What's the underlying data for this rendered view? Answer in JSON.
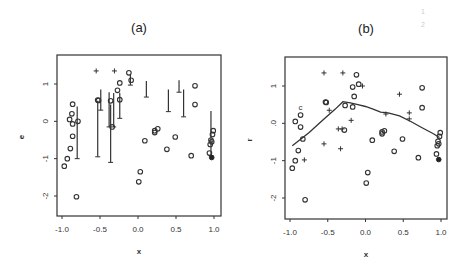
{
  "chart_data": [
    {
      "type": "scatter",
      "panel": "(a)",
      "title": "(a)",
      "xlabel": "x",
      "ylabel": "e",
      "xlim": [
        -1.05,
        1.05
      ],
      "ylim": [
        -2.6,
        1.6
      ],
      "xticks": [
        "-1.0",
        "-0.5",
        "0.0",
        "0.5",
        "1.0"
      ],
      "yticks": [
        "1",
        "0",
        "-1",
        "-2"
      ],
      "grid": false,
      "legend": null,
      "circles": [
        [
          -0.97,
          -1.2
        ],
        [
          -0.93,
          -1.0
        ],
        [
          -0.89,
          -0.73
        ],
        [
          -0.81,
          -2.02
        ],
        [
          -0.86,
          -0.4
        ],
        [
          -0.86,
          -0.07
        ],
        [
          -0.87,
          0.2
        ],
        [
          -0.86,
          0.46
        ],
        [
          -0.9,
          0.05
        ],
        [
          -0.79,
          0.0
        ],
        [
          -0.53,
          0.57
        ],
        [
          -0.52,
          0.56
        ],
        [
          -0.36,
          0.55
        ],
        [
          -0.34,
          -0.15
        ],
        [
          -0.27,
          0.83
        ],
        [
          -0.24,
          0.58
        ],
        [
          -0.24,
          1.03
        ],
        [
          -0.12,
          1.3
        ],
        [
          -0.09,
          1.1
        ],
        [
          0.01,
          -1.62
        ],
        [
          0.03,
          -1.35
        ],
        [
          0.09,
          -0.52
        ],
        [
          0.22,
          -0.3
        ],
        [
          0.22,
          -0.25
        ],
        [
          0.26,
          -0.2
        ],
        [
          0.38,
          -0.75
        ],
        [
          0.49,
          -0.42
        ],
        [
          0.7,
          -0.92
        ],
        [
          0.75,
          0.95
        ],
        [
          0.75,
          0.45
        ],
        [
          0.94,
          -0.85
        ],
        [
          0.95,
          -0.62
        ],
        [
          0.96,
          -0.5
        ],
        [
          0.98,
          -0.35
        ],
        [
          0.99,
          -0.25
        ],
        [
          0.97,
          -0.55
        ]
      ],
      "filled_points": [
        [
          0.97,
          -0.97
        ]
      ],
      "plus_points": [
        [
          -0.55,
          1.35
        ],
        [
          -0.31,
          1.35
        ]
      ],
      "arrows_down": [
        {
          "x": -0.8,
          "from": 0.4,
          "to": -1.0
        },
        {
          "x": -0.53,
          "from": 0.55,
          "to": -0.95
        },
        {
          "x": -0.49,
          "from": 0.85,
          "to": 0.3
        },
        {
          "x": -0.38,
          "from": 0.78,
          "to": -0.15
        },
        {
          "x": -0.36,
          "from": 0.45,
          "to": -1.1
        },
        {
          "x": -0.32,
          "from": 0.76,
          "to": -0.15
        },
        {
          "x": -0.24,
          "from": 0.76,
          "to": 0.08
        },
        {
          "x": -0.1,
          "from": 1.25,
          "to": 0.97
        },
        {
          "x": 0.11,
          "from": 1.08,
          "to": 0.65
        },
        {
          "x": 0.4,
          "from": 0.85,
          "to": 0.26
        },
        {
          "x": 0.54,
          "from": 1.1,
          "to": 0.78
        },
        {
          "x": 0.6,
          "from": 0.85,
          "to": 0.12
        },
        {
          "x": 0.96,
          "from": 0.28,
          "to": -0.92
        }
      ]
    },
    {
      "type": "scatter",
      "panel": "(b)",
      "title": "(b)",
      "xlabel": "x",
      "ylabel": "r",
      "xlim": [
        -1.05,
        1.05
      ],
      "ylim": [
        -2.6,
        1.6
      ],
      "xticks": [
        "-1.0",
        "-0.5",
        "0.0",
        "0.5",
        "1.0"
      ],
      "yticks": [
        "1",
        ".0",
        "-1",
        "-2"
      ],
      "grid": false,
      "legend": null,
      "circles": [
        [
          -0.97,
          -1.2
        ],
        [
          -0.93,
          -1.0
        ],
        [
          -0.89,
          -0.73
        ],
        [
          -0.8,
          -2.05
        ],
        [
          -0.83,
          -0.42
        ],
        [
          -0.86,
          -0.1
        ],
        [
          -0.86,
          0.22
        ],
        [
          -0.93,
          0.05
        ],
        [
          -0.53,
          0.57
        ],
        [
          -0.52,
          0.56
        ],
        [
          -0.27,
          0.48
        ],
        [
          -0.28,
          -0.18
        ],
        [
          -0.17,
          0.97
        ],
        [
          -0.15,
          0.72
        ],
        [
          -0.12,
          1.3
        ],
        [
          -0.09,
          1.05
        ],
        [
          -0.17,
          0.44
        ],
        [
          0.01,
          -1.6
        ],
        [
          0.03,
          -1.32
        ],
        [
          0.09,
          -0.45
        ],
        [
          0.22,
          -0.28
        ],
        [
          0.22,
          -0.23
        ],
        [
          0.25,
          -0.2
        ],
        [
          0.38,
          -0.75
        ],
        [
          0.49,
          -0.42
        ],
        [
          0.7,
          -0.92
        ],
        [
          0.75,
          0.95
        ],
        [
          0.75,
          0.42
        ],
        [
          0.94,
          -0.82
        ],
        [
          0.95,
          -0.6
        ],
        [
          0.96,
          -0.48
        ],
        [
          0.98,
          -0.35
        ],
        [
          0.99,
          -0.25
        ],
        [
          0.97,
          -0.55
        ]
      ],
      "c_points": [
        [
          -0.86,
          0.45
        ]
      ],
      "filled_points": [
        [
          0.97,
          -0.97
        ]
      ],
      "plus_points": [
        [
          -0.55,
          1.35
        ],
        [
          -0.3,
          1.35
        ],
        [
          -0.04,
          1.0
        ],
        [
          -0.48,
          0.35
        ],
        [
          -0.19,
          0.08
        ],
        [
          -0.36,
          -0.15
        ],
        [
          -0.31,
          -0.15
        ],
        [
          -0.55,
          -0.55
        ],
        [
          -0.33,
          -0.68
        ],
        [
          -0.81,
          -0.98
        ],
        [
          0.45,
          0.78
        ],
        [
          0.58,
          0.28
        ],
        [
          0.58,
          0.12
        ],
        [
          0.27,
          0.25
        ]
      ],
      "line": {
        "x": [
          -0.97,
          -0.75,
          -0.55,
          -0.4,
          -0.3,
          -0.2,
          -0.1,
          0.0,
          0.1,
          0.2,
          0.3,
          0.45,
          0.6,
          0.75,
          0.9,
          0.98
        ],
        "y": [
          -0.6,
          -0.25,
          0.12,
          0.38,
          0.58,
          0.55,
          0.5,
          0.45,
          0.38,
          0.3,
          0.28,
          0.2,
          0.05,
          -0.12,
          -0.28,
          -0.38
        ]
      }
    }
  ],
  "page_marks": [
    "1",
    "2"
  ]
}
